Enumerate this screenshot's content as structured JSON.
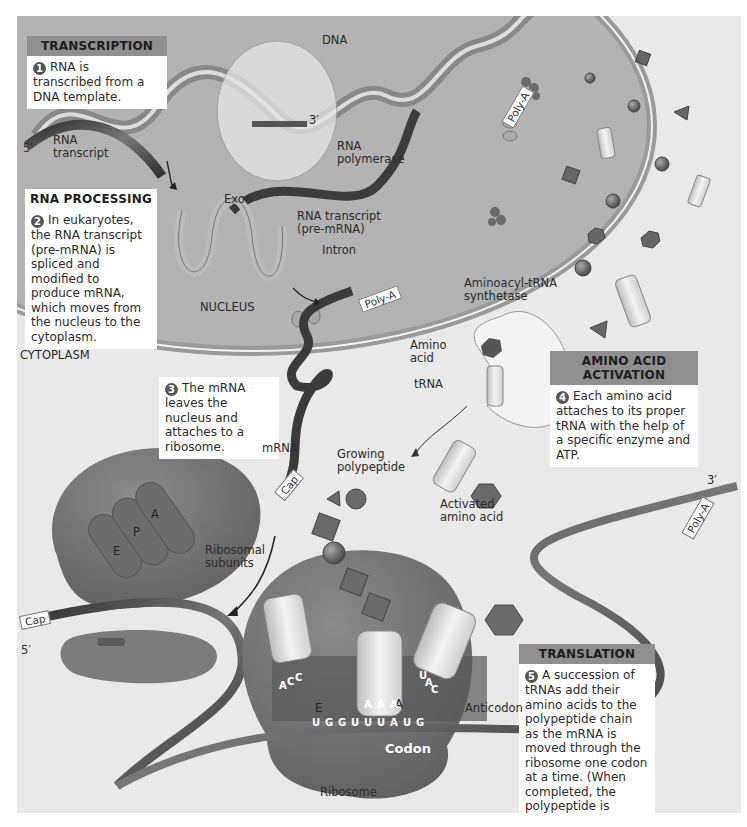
{
  "figure": {
    "regions": {
      "nucleus": "NUCLEUS",
      "cytoplasm": "CYTOPLASM"
    },
    "steps": [
      {
        "number": "1",
        "title": "TRANSCRIPTION",
        "text": "RNA is transcribed from a DNA template."
      },
      {
        "number": "2",
        "title": "RNA PROCESSING",
        "text": "In eukaryotes, the RNA transcript (pre-mRNA) is spliced and modified to produce mRNA, which moves from the nucleus to the cytoplasm."
      },
      {
        "number": "3",
        "title": "",
        "text": "The mRNA leaves the nucleus and attaches to a ribosome."
      },
      {
        "number": "4",
        "title": "AMINO ACID ACTIVATION",
        "text": "Each amino acid attaches to its proper tRNA with the help of a specific enzyme and ATP."
      },
      {
        "number": "5",
        "title": "TRANSLATION",
        "text": "A succession of tRNAs add their amino acids to the polypeptide chain as the mRNA is moved through the ribosome one codon at a time. (When completed, the polypeptide is released from the ribosome.)"
      }
    ],
    "labels": {
      "dna": "DNA",
      "three_prime_top": "3′",
      "five_prime_top": "5′",
      "rna_transcript": "RNA\ntranscript",
      "rna_polymerase": "RNA\npolymerase",
      "exon": "Exon",
      "rna_transcript_pre": "RNA transcript\n(pre-mRNA)",
      "intron": "Intron",
      "poly_a": "Poly-A",
      "aminoacyl_trna_synthetase": "Aminoacyl-tRNA\nsynthetase",
      "amino_acid": "Amino\nacid",
      "trna": "tRNA",
      "mrna": "mRNA",
      "cap": "Cap",
      "growing_polypeptide": "Growing\npolypeptide",
      "activated_amino_acid": "Activated\namino acid",
      "ribosomal_subunits": "Ribosomal\nsubunits",
      "site_e": "E",
      "site_p": "P",
      "site_a": "A",
      "five_prime_bottom": "5′",
      "three_prime_right": "3′",
      "anticodon": "Anticodon",
      "codon": "Codon",
      "ribosome": "Ribosome"
    },
    "sequences": {
      "mrna_codons": [
        "U",
        "G",
        "G",
        "U",
        "U",
        "U",
        "A",
        "U",
        "G"
      ],
      "anticodon_exit": [
        "A",
        "C",
        "C"
      ],
      "anticodon_p": [
        "A",
        "A",
        "A"
      ],
      "anticodon_a": [
        "U",
        "A",
        "C"
      ]
    },
    "colors": {
      "background": "#e9e9e9",
      "nucleus": "#b3b3b3",
      "header_banner": "#8f8f8f",
      "ribosome": "#6f6f6f",
      "ribbon_dark": "#3f3f3f"
    }
  }
}
